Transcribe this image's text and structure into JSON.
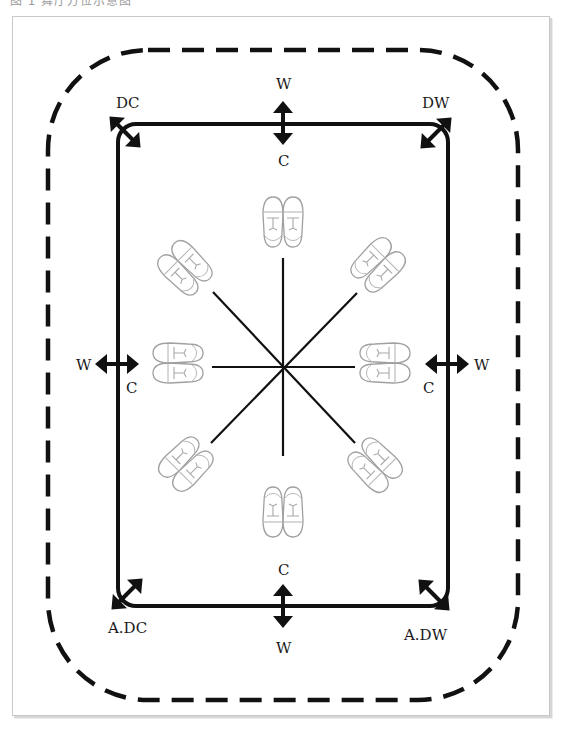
{
  "header": {
    "cut_off_text": "图 1 舞厅方位示意图"
  },
  "diagram": {
    "labels": {
      "top_outer": "W",
      "top_inner": "C",
      "bottom_inner": "C",
      "bottom_outer": "W",
      "left_outer": "W",
      "left_inner": "C",
      "right_outer": "W",
      "right_inner": "C",
      "top_left_corner": "DC",
      "top_right_corner": "DW",
      "bottom_left_corner": "A.DC",
      "bottom_right_corner": "A.DW"
    },
    "shoe_positions": [
      "top",
      "top-right",
      "right",
      "bottom-right",
      "bottom",
      "bottom-left",
      "left",
      "top-left"
    ],
    "colors": {
      "line": "#111111",
      "shoe_outline": "#9a9a9a",
      "frame_border": "#c8c8c8"
    }
  }
}
